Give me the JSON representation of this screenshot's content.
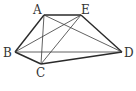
{
  "diagram": {
    "type": "geometry-figure",
    "stroke_color": "#2a2a2a",
    "points": {
      "A": {
        "label": "A",
        "x": 44,
        "y": 15
      },
      "E": {
        "label": "E",
        "x": 81,
        "y": 15
      },
      "B": {
        "label": "B",
        "x": 15,
        "y": 52
      },
      "C": {
        "label": "C",
        "x": 41,
        "y": 64
      },
      "D": {
        "label": "D",
        "x": 122,
        "y": 52
      }
    },
    "outer_edges": [
      [
        "A",
        "E"
      ],
      [
        "E",
        "D"
      ],
      [
        "D",
        "C"
      ],
      [
        "C",
        "B"
      ],
      [
        "B",
        "A"
      ]
    ],
    "diagonals": [
      [
        "B",
        "D"
      ],
      [
        "B",
        "E"
      ],
      [
        "A",
        "C"
      ],
      [
        "A",
        "D"
      ],
      [
        "C",
        "E"
      ]
    ]
  }
}
